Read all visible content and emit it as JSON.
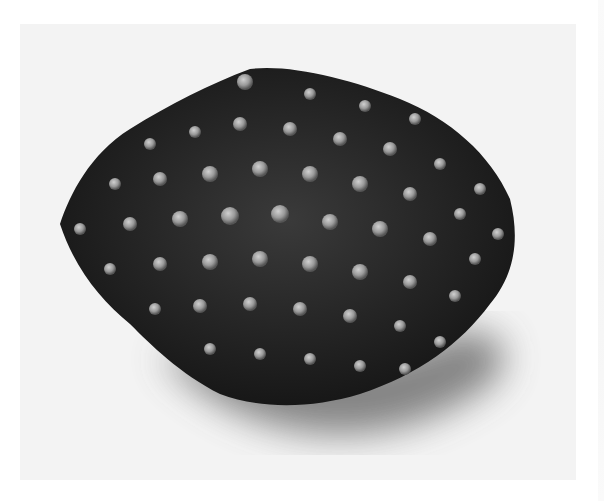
{
  "image": {
    "subject": "beaded cluster brooch",
    "description": "Monochrome photo of a dark, roughly hexagonal beaded object made of many flower-shaped clusters with pale round bead centers, casting a soft shadow on a light background",
    "colors": {
      "background": "#f3f3f3",
      "border": "#ffffff",
      "object_dark": "#1a1a1a",
      "object_mid": "#4a4a4a",
      "bead_highlight": "#b8b8b8",
      "shadow": "#6a6a6a"
    }
  }
}
